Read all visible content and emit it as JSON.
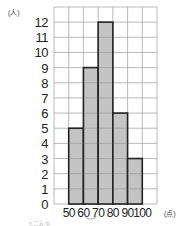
{
  "chart_data": {
    "type": "bar",
    "subtype": "histogram",
    "title": "",
    "xlabel": "(点)",
    "ylabel": "(人)",
    "categories": [
      "50-60",
      "60-70",
      "70-80",
      "80-90",
      "90-100"
    ],
    "bin_edges": [
      50,
      60,
      70,
      80,
      90,
      100
    ],
    "values": [
      5,
      9,
      12,
      6,
      3
    ],
    "x_tick_labels": [
      "50",
      "60",
      "70",
      "80",
      "90",
      "100"
    ],
    "y_tick_labels": [
      "0",
      "1",
      "2",
      "3",
      "4",
      "5",
      "6",
      "7",
      "8",
      "9",
      "10",
      "11",
      "12"
    ],
    "xlim": [
      40,
      110
    ],
    "ylim": [
      0,
      13
    ],
    "grid": true,
    "legend": null,
    "bar_color": "#c4c4c4",
    "bar_edge_color": "#222222",
    "grid_color": "#a8a8a8"
  },
  "labels": {
    "y_unit": "(人)",
    "x_unit": "(点)",
    "faint_note": "ミ二ゐゆ"
  }
}
